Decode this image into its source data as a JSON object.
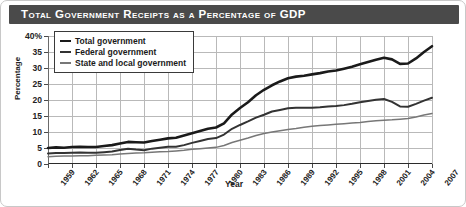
{
  "header": {
    "title": "Total Government Receipts as a Percentage of GDP"
  },
  "legend": {
    "position": "top-left",
    "items": [
      {
        "label": "Total government",
        "color": "#1a1a1a",
        "width": 2.6,
        "icon": "line-swatch-icon"
      },
      {
        "label": "Federal government",
        "color": "#333333",
        "width": 2.0,
        "icon": "line-swatch-icon"
      },
      {
        "label": "State and local government",
        "color": "#777777",
        "width": 1.5,
        "icon": "line-swatch-icon"
      }
    ]
  },
  "chart_data": {
    "type": "line",
    "title": "Total Government Receipts as a Percentage of GDP",
    "xlabel": "Year",
    "ylabel": "Percentage",
    "xlim": [
      1959,
      2007
    ],
    "ylim": [
      0,
      40
    ],
    "ytick_labels": [
      "0",
      "5",
      "10",
      "15",
      "20",
      "25",
      "30",
      "35",
      "40%"
    ],
    "ytick_values": [
      0,
      5,
      10,
      15,
      20,
      25,
      30,
      35,
      40
    ],
    "xtick_labels": [
      "1959",
      "1962",
      "1965",
      "1968",
      "1971",
      "1974",
      "1977",
      "1980",
      "1983",
      "1986",
      "1989",
      "1992",
      "1995",
      "1998",
      "2001",
      "2004",
      "2007"
    ],
    "xtick_values": [
      1959,
      1962,
      1965,
      1968,
      1971,
      1974,
      1977,
      1980,
      1983,
      1986,
      1989,
      1992,
      1995,
      1998,
      2001,
      2004,
      2007
    ],
    "grid": true,
    "x": [
      1959,
      1960,
      1961,
      1962,
      1963,
      1964,
      1965,
      1966,
      1967,
      1968,
      1969,
      1970,
      1971,
      1972,
      1973,
      1974,
      1975,
      1976,
      1977,
      1978,
      1979,
      1980,
      1981,
      1982,
      1983,
      1984,
      1985,
      1986,
      1987,
      1988,
      1989,
      1990,
      1991,
      1992,
      1993,
      1994,
      1995,
      1996,
      1997,
      1998,
      1999,
      2000,
      2001,
      2002,
      2003,
      2004,
      2005,
      2006,
      2007
    ],
    "series": [
      {
        "name": "Total government",
        "color": "#1a1a1a",
        "values": [
          5.0,
          5.2,
          5.1,
          5.3,
          5.4,
          5.3,
          5.3,
          5.6,
          5.9,
          6.4,
          6.9,
          6.8,
          6.7,
          7.2,
          7.6,
          8.0,
          8.2,
          8.9,
          9.6,
          10.3,
          11.0,
          11.4,
          12.7,
          15.5,
          17.5,
          19.3,
          21.5,
          23.2,
          24.6,
          25.8,
          26.8,
          27.3,
          27.6,
          28.0,
          28.4,
          28.9,
          29.2,
          29.8,
          30.4,
          31.2,
          31.9,
          32.6,
          33.2,
          32.7,
          31.3,
          31.4,
          33.0,
          35.0,
          36.8
        ]
      },
      {
        "name": "Federal government",
        "color": "#333333",
        "values": [
          3.3,
          3.4,
          3.4,
          3.5,
          3.6,
          3.5,
          3.5,
          3.7,
          3.9,
          4.4,
          4.8,
          4.5,
          4.3,
          4.8,
          5.1,
          5.4,
          5.4,
          5.9,
          6.6,
          7.2,
          7.8,
          8.1,
          9.2,
          11.0,
          12.2,
          13.3,
          14.5,
          15.4,
          16.4,
          16.9,
          17.4,
          17.6,
          17.6,
          17.6,
          17.7,
          18.0,
          18.1,
          18.4,
          18.8,
          19.3,
          19.7,
          20.1,
          20.3,
          19.4,
          18.0,
          17.9,
          18.8,
          19.8,
          20.7
        ]
      },
      {
        "name": "State and local government",
        "color": "#777777",
        "values": [
          2.3,
          2.4,
          2.5,
          2.5,
          2.6,
          2.6,
          2.7,
          2.8,
          2.9,
          3.1,
          3.3,
          3.4,
          3.5,
          3.7,
          3.8,
          3.9,
          4.1,
          4.3,
          4.6,
          4.8,
          5.0,
          5.2,
          5.8,
          6.7,
          7.4,
          8.1,
          8.9,
          9.5,
          10.0,
          10.4,
          10.8,
          11.1,
          11.5,
          11.8,
          12.0,
          12.2,
          12.4,
          12.6,
          12.8,
          13.0,
          13.3,
          13.5,
          13.7,
          13.8,
          14.0,
          14.2,
          14.7,
          15.3,
          15.8
        ]
      }
    ]
  }
}
